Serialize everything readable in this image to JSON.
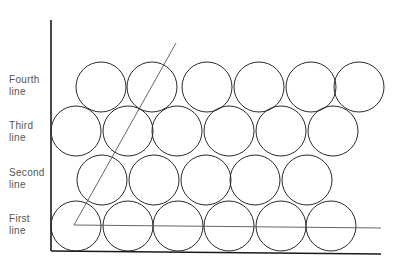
{
  "labels": {
    "fourth": [
      "Fourth",
      "line"
    ],
    "third": [
      "Third",
      "line"
    ],
    "second": [
      "Second",
      "line"
    ],
    "first": [
      "First",
      "line"
    ]
  },
  "colors": {
    "stroke": "#2a2a2a",
    "axis": "#1a1a1a",
    "label": "#555555",
    "background": "#ffffff"
  },
  "circle_radius": 25,
  "rows": [
    {
      "name": "first-line",
      "cy": 226,
      "cx": [
        76,
        128,
        178,
        229,
        281,
        331
      ]
    },
    {
      "name": "second-line",
      "cy": 180,
      "cx": [
        102,
        154,
        206,
        255,
        307
      ]
    },
    {
      "name": "third-line",
      "cy": 131,
      "cx": [
        76,
        128,
        177,
        229,
        281,
        333
      ]
    },
    {
      "name": "fourth-line",
      "cy": 87,
      "cx": [
        101,
        152,
        207,
        259,
        311,
        359
      ]
    }
  ],
  "axes": {
    "origin": [
      51,
      251
    ],
    "top": [
      51,
      20
    ],
    "right": [
      381,
      254
    ]
  },
  "triangle": {
    "vertex": [
      74,
      225
    ],
    "diag_end": [
      176,
      43
    ],
    "base_end": [
      381,
      228
    ]
  }
}
